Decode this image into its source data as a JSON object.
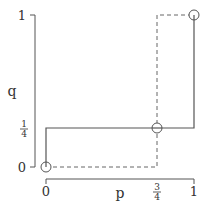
{
  "diagram": {
    "axes": {
      "x_label": "p",
      "y_label": "q",
      "x_ticks": [
        {
          "label": "0",
          "value": 0
        },
        {
          "label_num": "3",
          "label_den": "4",
          "value": 0.75
        },
        {
          "label": "1",
          "value": 1
        }
      ],
      "y_ticks": [
        {
          "label": "0",
          "value": 0
        },
        {
          "label_num": "1",
          "label_den": "4",
          "value": 0.25
        },
        {
          "label": "1",
          "value": 1
        }
      ]
    },
    "solid_path": {
      "description": "best response of player 1: q as function of p",
      "points": [
        [
          0,
          0
        ],
        [
          0,
          0.25
        ],
        [
          1,
          0.25
        ],
        [
          1,
          1
        ]
      ]
    },
    "dashed_path": {
      "description": "best response of player 2",
      "points": [
        [
          0,
          0
        ],
        [
          0.75,
          0
        ],
        [
          0.75,
          1
        ],
        [
          1,
          1
        ]
      ]
    },
    "intersections": [
      {
        "p": 0,
        "q": 0
      },
      {
        "p": 0.75,
        "q": 0.25
      },
      {
        "p": 1,
        "q": 1
      }
    ],
    "colors": {
      "line": "#555555",
      "text": "#333333"
    }
  }
}
